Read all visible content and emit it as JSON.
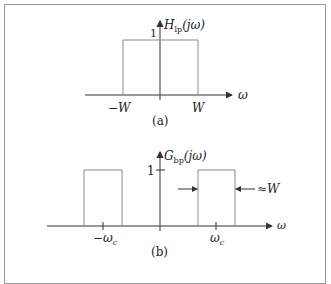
{
  "figure_a": {
    "caption": "(a)",
    "function_label": {
      "main": "H",
      "sub": "lp",
      "arg": "(jω)"
    },
    "height_label": "1",
    "x_axis_label": "ω",
    "left_edge_label": "−W",
    "right_edge_label": "W"
  },
  "figure_b": {
    "caption": "(b)",
    "function_label": {
      "main": "G",
      "sub": "bp",
      "arg": "(jω)"
    },
    "height_label": "1",
    "x_axis_label": "ω",
    "left_center_label": {
      "main": "−ω",
      "sub": "c"
    },
    "right_center_label": {
      "main": "ω",
      "sub": "c"
    },
    "width_annotation": "≈W"
  },
  "colors": {
    "line": "#8a8a8a",
    "axis": "#333333",
    "frame": "#9a9a9a"
  }
}
